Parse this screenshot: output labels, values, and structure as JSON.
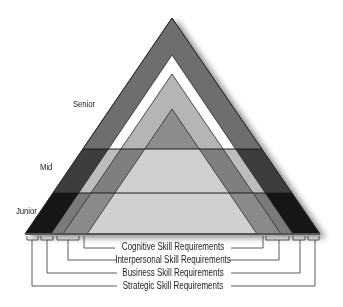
{
  "diagram": {
    "levels": [
      {
        "label": "Senior"
      },
      {
        "label": "Mid"
      },
      {
        "label": "Junior"
      }
    ],
    "legend": [
      {
        "label": "Cognitive Skill Requirements"
      },
      {
        "label": "Interpersonal Skill Requirements"
      },
      {
        "label": "Business Skill Requirements"
      },
      {
        "label": "Strategic Skill Requirements"
      }
    ],
    "colors": {
      "outline": "#2a2a2a",
      "background": "#ffffff"
    }
  }
}
